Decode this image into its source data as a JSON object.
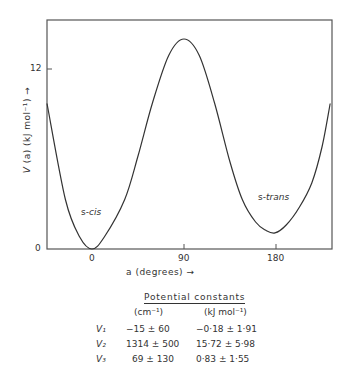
{
  "chart_data": {
    "type": "line",
    "title": "",
    "xlabel": "a (degrees) →",
    "ylabel": "V (a) (kJ mol⁻¹) →",
    "xlim": [
      -44,
      235
    ],
    "ylim": [
      0,
      15.3
    ],
    "x_ticks": [
      0,
      90,
      180
    ],
    "x_tick_labels": [
      "0",
      "90",
      "180"
    ],
    "y_ticks": [
      0,
      12
    ],
    "y_tick_labels": [
      "0",
      "12"
    ],
    "grid": false,
    "legend": null,
    "series": [
      {
        "name": "V(a)",
        "x": [
          -44,
          -26,
          -12,
          0,
          12,
          32,
          45,
          59,
          75,
          90,
          105,
          120,
          135,
          147,
          160,
          170,
          179,
          190,
          203,
          215,
          225,
          233
        ],
        "y": [
          9.7,
          3.3,
          0.8,
          0.0,
          0.8,
          3.3,
          6.2,
          9.7,
          12.9,
          14.0,
          12.9,
          9.7,
          5.8,
          3.3,
          1.8,
          1.25,
          1.07,
          1.6,
          2.8,
          4.4,
          6.8,
          9.7
        ]
      }
    ],
    "annotations": [
      {
        "text_prefix": "s-",
        "text_italic": "cis",
        "x": 0,
        "y": 2.5
      },
      {
        "text_prefix": "s-",
        "text_italic": "trans",
        "x": 180,
        "y": 3.5
      }
    ],
    "table": {
      "title": "Potential constants",
      "columns": [
        "(cm⁻¹)",
        "(kJ mol⁻¹)"
      ],
      "rows": [
        {
          "name": "V₁",
          "cm": "−15 ± 60",
          "kj": "−0·18 ± 1·91"
        },
        {
          "name": "V₂",
          "cm": "1314 ± 500",
          "kj": "15·72 ± 5·98"
        },
        {
          "name": "V₃",
          "cm": "69 ± 130",
          "kj": "0·83 ± 1·55"
        }
      ]
    }
  },
  "labels": {
    "ylabel_prefix": "V",
    "ylabel_rest": " (a) (kJ mol⁻¹) →",
    "xlabel": "a (degrees) →",
    "cis_prefix": "s-",
    "cis_italic": "cis",
    "trans_prefix": "s-",
    "trans_italic": "trans",
    "tick_y0": "0",
    "tick_y12": "12",
    "tick_x0": "0",
    "tick_x90": "90",
    "tick_x180": "180"
  },
  "colors": {
    "line": "#333333",
    "axis": "#555555",
    "background": "#ffffff"
  }
}
